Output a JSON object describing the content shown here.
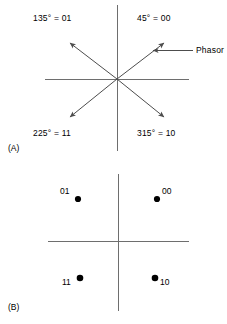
{
  "figure": {
    "panels": [
      {
        "tag": "(A)",
        "type": "phasor-diagram",
        "annotation_label": "Phasor",
        "phasors": [
          {
            "id": "phasor-45",
            "label": "45° = 00",
            "angle_deg": 45,
            "bits": "00",
            "label_x": 137,
            "label_y": 18
          },
          {
            "id": "phasor-135",
            "label": "135° = 01",
            "angle_deg": 135,
            "bits": "01",
            "label_x": 33,
            "label_y": 18
          },
          {
            "id": "phasor-225",
            "label": "225° = 11",
            "angle_deg": 225,
            "bits": "11",
            "label_x": 33,
            "label_y": 132
          },
          {
            "id": "phasor-315",
            "label": "315° = 10",
            "angle_deg": 315,
            "bits": "10",
            "label_x": 137,
            "label_y": 132
          }
        ]
      },
      {
        "tag": "(B)",
        "type": "constellation-diagram",
        "points": [
          {
            "id": "point-01",
            "label": "01",
            "x": 78,
            "y": 199,
            "label_x": 60,
            "label_y": 189,
            "quadrant": "upper-left"
          },
          {
            "id": "point-00",
            "label": "00",
            "x": 157,
            "y": 199,
            "label_x": 162,
            "label_y": 189,
            "quadrant": "upper-right"
          },
          {
            "id": "point-11",
            "label": "11",
            "x": 80,
            "y": 278,
            "label_x": 62,
            "label_y": 281,
            "quadrant": "lower-left"
          },
          {
            "id": "point-10",
            "label": "10",
            "x": 155,
            "y": 278,
            "label_x": 160,
            "label_y": 281,
            "quadrant": "lower-right"
          }
        ]
      }
    ],
    "colors": {
      "axis": "#6e6e6e",
      "phasor": "#4d4d4d",
      "point": "#000000",
      "text": "#000000",
      "background": "#ffffff"
    }
  }
}
